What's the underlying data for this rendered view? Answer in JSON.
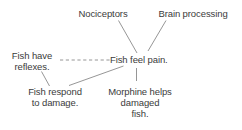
{
  "diagram": {
    "type": "concept-map",
    "background_color": "#ffffff",
    "text_color": "#3b3b3b",
    "line_color": "#8a8a8a",
    "nodes": [
      {
        "id": "nociceptors",
        "label": "Nociceptors"
      },
      {
        "id": "brain_processing",
        "label": "Brain processing"
      },
      {
        "id": "fish_have_reflexes",
        "label": "Fish have\nreflexes."
      },
      {
        "id": "fish_feel_pain",
        "label": "Fish feel pain."
      },
      {
        "id": "fish_respond_to_damage",
        "label": "Fish respond\nto damage."
      },
      {
        "id": "morphine_helps",
        "label": "Morphine helps\ndamaged\nfish."
      }
    ],
    "edges": [
      {
        "from": "nociceptors",
        "to": "fish_feel_pain",
        "style": "solid"
      },
      {
        "from": "brain_processing",
        "to": "fish_feel_pain",
        "style": "solid"
      },
      {
        "from": "fish_have_reflexes",
        "to": "fish_feel_pain",
        "style": "dashed"
      },
      {
        "from": "fish_respond_to_damage",
        "to": "fish_feel_pain",
        "style": "solid"
      },
      {
        "from": "fish_respond_to_damage",
        "to": "fish_have_reflexes",
        "style": "solid"
      },
      {
        "from": "morphine_helps",
        "to": "fish_feel_pain",
        "style": "solid"
      }
    ]
  }
}
